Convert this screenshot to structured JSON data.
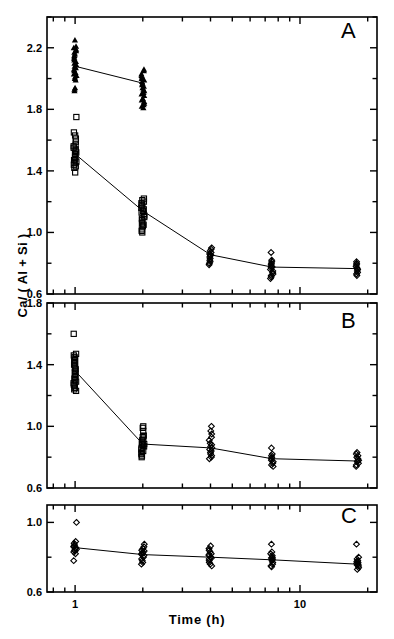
{
  "figure": {
    "axis_titles": {
      "y": "Ca/ ( Al + Si )",
      "x": "Time  (h)"
    },
    "panels": [
      {
        "letter": "A"
      },
      {
        "letter": "B"
      },
      {
        "letter": "C"
      }
    ],
    "x_tick_labels": [
      "1",
      "10"
    ],
    "panel_a_y_tick_labels": [
      "0.6",
      "1.0",
      "1.4",
      "1.8",
      "2.2"
    ],
    "panel_b_y_tick_labels": [
      "0.6",
      "1.0",
      "1.4",
      "1.8"
    ],
    "panel_c_y_tick_labels": [
      "0.6",
      "1.0"
    ]
  },
  "chart_data": [
    {
      "type": "scatter",
      "title": "A",
      "xlabel": "Time  (h)",
      "ylabel": "Ca/ ( Al + Si )",
      "xscale": "log",
      "xlim": [
        0.75,
        22
      ],
      "ylim": [
        0.6,
        2.4
      ],
      "yticks": [
        0.6,
        1.0,
        1.4,
        1.8,
        2.2
      ],
      "xticks": [
        1,
        10
      ],
      "grid": false,
      "legend": "none",
      "series": [
        {
          "name": "triangle-series",
          "marker": "triangle-filled",
          "x": [
            1,
            2
          ],
          "mean_values": [
            2.08,
            1.97
          ],
          "spread_min": [
            1.92,
            1.81
          ],
          "spread_max": [
            2.25,
            2.06
          ],
          "points": [
            {
              "x": 1,
              "values": [
                2.25,
                2.21,
                2.2,
                2.19,
                2.18,
                2.17,
                2.16,
                2.15,
                2.14,
                2.13,
                2.12,
                2.11,
                2.1,
                2.09,
                2.08,
                2.07,
                2.06,
                2.05,
                2.04,
                2.03,
                2.02,
                2.01,
                2.0,
                1.99,
                1.94,
                1.93,
                1.92
              ]
            },
            {
              "x": 2,
              "values": [
                2.06,
                2.05,
                2.03,
                2.02,
                2.01,
                2.0,
                1.99,
                1.98,
                1.97,
                1.96,
                1.95,
                1.94,
                1.93,
                1.92,
                1.91,
                1.9,
                1.89,
                1.87,
                1.86,
                1.85,
                1.84,
                1.83,
                1.82,
                1.81
              ]
            }
          ]
        },
        {
          "name": "square-series",
          "marker": "square-open",
          "x": [
            1,
            2
          ],
          "mean_values": [
            1.51,
            1.14
          ],
          "spread_min": [
            1.39,
            1.0
          ],
          "spread_max": [
            1.75,
            1.22
          ],
          "points": [
            {
              "x": 1,
              "values": [
                1.75,
                1.65,
                1.63,
                1.61,
                1.59,
                1.57,
                1.56,
                1.55,
                1.54,
                1.53,
                1.52,
                1.51,
                1.5,
                1.49,
                1.48,
                1.47,
                1.46,
                1.45,
                1.44,
                1.43,
                1.42,
                1.39
              ]
            },
            {
              "x": 2,
              "values": [
                1.22,
                1.21,
                1.2,
                1.19,
                1.18,
                1.17,
                1.16,
                1.15,
                1.14,
                1.13,
                1.12,
                1.11,
                1.1,
                1.09,
                1.08,
                1.07,
                1.06,
                1.05,
                1.04,
                1.02,
                1.01,
                1.0
              ]
            }
          ]
        },
        {
          "name": "diamond-series",
          "marker": "diamond-open",
          "x": [
            4,
            7.5,
            18
          ],
          "mean_values": [
            0.855,
            0.775,
            0.765
          ],
          "spread_min": [
            0.79,
            0.7,
            0.72
          ],
          "spread_max": [
            0.9,
            0.87,
            0.81
          ],
          "points": [
            {
              "x": 4,
              "values": [
                0.9,
                0.89,
                0.88,
                0.87,
                0.86,
                0.855,
                0.85,
                0.84,
                0.83,
                0.82,
                0.81,
                0.8,
                0.79
              ]
            },
            {
              "x": 7.5,
              "values": [
                0.87,
                0.82,
                0.81,
                0.8,
                0.79,
                0.78,
                0.775,
                0.77,
                0.76,
                0.75,
                0.74,
                0.73,
                0.72,
                0.71,
                0.7
              ]
            },
            {
              "x": 18,
              "values": [
                0.81,
                0.8,
                0.79,
                0.78,
                0.77,
                0.765,
                0.76,
                0.75,
                0.74,
                0.73,
                0.72
              ]
            }
          ]
        }
      ],
      "trend_lines": [
        {
          "name": "triangle-trend",
          "x": [
            1,
            2
          ],
          "y": [
            2.08,
            1.97
          ]
        },
        {
          "name": "square-diamond-trend",
          "x": [
            1,
            2,
            4,
            7.5,
            18
          ],
          "y": [
            1.51,
            1.14,
            0.855,
            0.775,
            0.765
          ]
        }
      ]
    },
    {
      "type": "scatter",
      "title": "B",
      "xlabel": "Time  (h)",
      "ylabel": "Ca/ ( Al + Si )",
      "xscale": "log",
      "xlim": [
        0.75,
        22
      ],
      "ylim": [
        0.6,
        1.8
      ],
      "yticks": [
        0.6,
        1.0,
        1.4,
        1.8
      ],
      "xticks": [
        1,
        10
      ],
      "grid": false,
      "legend": "none",
      "series": [
        {
          "name": "square-series",
          "marker": "square-open",
          "x": [
            1,
            2
          ],
          "mean_values": [
            1.36,
            0.885
          ],
          "spread_min": [
            1.23,
            0.8
          ],
          "spread_max": [
            1.6,
            1.0
          ],
          "points": [
            {
              "x": 1,
              "values": [
                1.6,
                1.47,
                1.46,
                1.45,
                1.44,
                1.43,
                1.42,
                1.41,
                1.4,
                1.39,
                1.38,
                1.37,
                1.36,
                1.35,
                1.34,
                1.33,
                1.32,
                1.31,
                1.3,
                1.29,
                1.28,
                1.27,
                1.26,
                1.25,
                1.24,
                1.23
              ]
            },
            {
              "x": 2,
              "values": [
                1.0,
                0.99,
                0.97,
                0.94,
                0.93,
                0.92,
                0.91,
                0.9,
                0.89,
                0.885,
                0.88,
                0.87,
                0.86,
                0.85,
                0.84,
                0.83,
                0.82,
                0.81,
                0.8
              ]
            }
          ]
        },
        {
          "name": "diamond-series",
          "marker": "diamond-open",
          "x": [
            4,
            7.5,
            18
          ],
          "mean_values": [
            0.86,
            0.79,
            0.775
          ],
          "spread_min": [
            0.79,
            0.74,
            0.74
          ],
          "spread_max": [
            1.0,
            0.86,
            0.83
          ],
          "points": [
            {
              "x": 4,
              "values": [
                1.0,
                0.97,
                0.95,
                0.93,
                0.91,
                0.89,
                0.88,
                0.87,
                0.86,
                0.85,
                0.84,
                0.83,
                0.82,
                0.81,
                0.8,
                0.79
              ]
            },
            {
              "x": 7.5,
              "values": [
                0.86,
                0.82,
                0.81,
                0.8,
                0.79,
                0.78,
                0.77,
                0.76,
                0.75,
                0.74
              ]
            },
            {
              "x": 18,
              "values": [
                0.83,
                0.82,
                0.81,
                0.8,
                0.79,
                0.78,
                0.775,
                0.77,
                0.76,
                0.75,
                0.74
              ]
            }
          ]
        }
      ],
      "trend_lines": [
        {
          "name": "main-trend",
          "x": [
            1,
            2,
            4,
            7.5,
            18
          ],
          "y": [
            1.36,
            0.885,
            0.86,
            0.79,
            0.775
          ]
        }
      ]
    },
    {
      "type": "scatter",
      "title": "C",
      "xlabel": "Time  (h)",
      "ylabel": "Ca/ ( Al + Si )",
      "xscale": "log",
      "xlim": [
        0.75,
        22
      ],
      "ylim": [
        0.6,
        1.1
      ],
      "yticks": [
        0.6,
        1.0
      ],
      "xticks": [
        1,
        10
      ],
      "grid": false,
      "legend": "none",
      "series": [
        {
          "name": "diamond-series",
          "marker": "diamond-open",
          "x": [
            1,
            2,
            4,
            7.5,
            18
          ],
          "mean_values": [
            0.855,
            0.815,
            0.8,
            0.785,
            0.76
          ],
          "spread_min": [
            0.78,
            0.76,
            0.75,
            0.745,
            0.73
          ],
          "spread_max": [
            1.0,
            0.875,
            0.865,
            0.875,
            0.875
          ],
          "points": [
            {
              "x": 1,
              "values": [
                1.0,
                0.89,
                0.88,
                0.87,
                0.865,
                0.86,
                0.855,
                0.85,
                0.845,
                0.84,
                0.835,
                0.83,
                0.82,
                0.78
              ]
            },
            {
              "x": 2,
              "values": [
                0.875,
                0.86,
                0.85,
                0.84,
                0.835,
                0.83,
                0.825,
                0.82,
                0.815,
                0.81,
                0.8,
                0.79,
                0.78,
                0.77,
                0.76
              ]
            },
            {
              "x": 4,
              "values": [
                0.865,
                0.85,
                0.84,
                0.83,
                0.82,
                0.815,
                0.81,
                0.8,
                0.795,
                0.79,
                0.78,
                0.77,
                0.76,
                0.75
              ]
            },
            {
              "x": 7.5,
              "values": [
                0.875,
                0.83,
                0.82,
                0.81,
                0.8,
                0.795,
                0.79,
                0.785,
                0.78,
                0.77,
                0.76,
                0.75,
                0.745
              ]
            },
            {
              "x": 18,
              "values": [
                0.875,
                0.8,
                0.79,
                0.78,
                0.775,
                0.77,
                0.765,
                0.76,
                0.755,
                0.75,
                0.74,
                0.73
              ]
            }
          ]
        }
      ],
      "trend_lines": [
        {
          "name": "main-trend",
          "x": [
            1,
            2,
            4,
            7.5,
            18
          ],
          "y": [
            0.855,
            0.815,
            0.8,
            0.785,
            0.76
          ]
        }
      ]
    }
  ]
}
